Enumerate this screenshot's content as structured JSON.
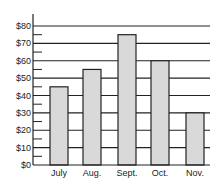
{
  "chart_data": {
    "type": "bar",
    "title": "",
    "xlabel": "",
    "ylabel": "",
    "categories": [
      "July",
      "Aug.",
      "Sept.",
      "Oct.",
      "Nov."
    ],
    "values": [
      45,
      55,
      75,
      60,
      30
    ],
    "ylim": [
      0,
      80
    ],
    "yticks": [
      "$0",
      "$10",
      "$20",
      "$30",
      "$40",
      "$50",
      "$60",
      "$70",
      "$80"
    ],
    "grid": true,
    "legend": null,
    "colors": {
      "bar_fill": "#d9d9d9",
      "bar_stroke": "#222222",
      "grid": "#222222"
    }
  }
}
